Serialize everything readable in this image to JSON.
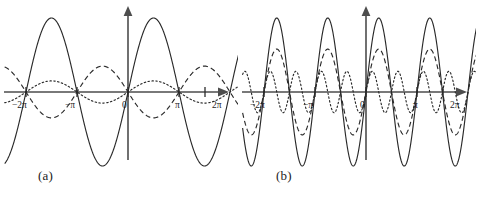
{
  "figure": {
    "background_color": "#ffffff",
    "stroke_color": "#2a2a2a",
    "axis_color": "#4d4d4d",
    "panels": [
      {
        "caption": "(a)",
        "caption_x": 38,
        "axis": {
          "x_tick_labels": [
            "−2π",
            "−π",
            "0",
            "π",
            "2π"
          ],
          "x_tick_values": [
            -6.2832,
            -3.1416,
            0,
            3.1416,
            6.2832
          ],
          "x_arrow_label": "",
          "xlim": [
            -7.6,
            7.7
          ],
          "ylim": [
            -1.12,
            1.12
          ],
          "grid": false
        }
      },
      {
        "caption": "(b)",
        "caption_x": 38,
        "axis": {
          "x_tick_labels": [
            "−2π",
            "−π",
            "0",
            "π",
            "2π"
          ],
          "x_tick_values": [
            -6.2832,
            -3.1416,
            0,
            3.1416,
            6.2832
          ],
          "x_arrow_label": "",
          "xlim": [
            -7.6,
            7.7
          ],
          "ylim": [
            -1.12,
            1.12
          ],
          "grid": false
        }
      }
    ]
  },
  "chart_data": [
    {
      "type": "line",
      "title": "(a)",
      "xlabel": "",
      "ylabel": "",
      "xlim": [
        -7.6,
        7.7
      ],
      "ylim": [
        -1.12,
        1.12
      ],
      "grid": false,
      "legend": "none",
      "xtick_labels": [
        "−2π",
        "−π",
        "0",
        "π",
        "2π"
      ],
      "xtick_values": [
        -6.2832,
        -3.1416,
        0,
        3.1416,
        6.2832
      ],
      "series": [
        {
          "name": "solid",
          "style": "solid",
          "amplitude": 1.0,
          "frequency": 1,
          "phase": 0,
          "formula": "sin(x)",
          "samples_x": [
            -7.6,
            -6.2832,
            -4.7124,
            -3.1416,
            -1.5708,
            0,
            1.5708,
            3.1416,
            4.7124,
            6.2832,
            7.7
          ],
          "samples_y": [
            -0.968,
            0,
            1.0,
            0,
            -1.0,
            0,
            1.0,
            0,
            -1.0,
            0,
            0.992
          ]
        },
        {
          "name": "dashed",
          "style": "dashed",
          "amplitude": 0.35,
          "frequency": 1,
          "phase": 3.1416,
          "formula": "-0.35*sin(x)",
          "samples_x": [
            -7.6,
            -6.2832,
            -4.7124,
            -3.1416,
            -1.5708,
            0,
            1.5708,
            3.1416,
            4.7124,
            6.2832,
            7.7
          ],
          "samples_y": [
            0.339,
            0,
            -0.35,
            0,
            0.35,
            0,
            -0.35,
            0,
            0.35,
            0,
            -0.347
          ]
        },
        {
          "name": "dotted",
          "style": "dotted",
          "amplitude": 0.15,
          "frequency": 1,
          "phase": 0,
          "formula": "0.15*sin(x)",
          "samples_x": [
            -7.6,
            -6.2832,
            -4.7124,
            -3.1416,
            -1.5708,
            0,
            1.5708,
            3.1416,
            4.7124,
            6.2832,
            7.7
          ],
          "samples_y": [
            -0.145,
            0,
            0.15,
            0,
            -0.15,
            0,
            0.15,
            0,
            -0.15,
            0,
            0.149
          ]
        }
      ]
    },
    {
      "type": "line",
      "title": "(b)",
      "xlabel": "",
      "ylabel": "",
      "xlim": [
        -7.6,
        7.7
      ],
      "ylim": [
        -1.12,
        1.12
      ],
      "grid": false,
      "legend": "none",
      "xtick_labels": [
        "−2π",
        "−π",
        "0",
        "π",
        "2π"
      ],
      "xtick_values": [
        -6.2832,
        -3.1416,
        0,
        3.1416,
        6.2832
      ],
      "series": [
        {
          "name": "solid",
          "style": "solid",
          "amplitude": 1.0,
          "frequency": 2,
          "phase": 0,
          "formula": "sin(2x)",
          "samples_x": [
            -7.6,
            -6.2832,
            -5.4978,
            -4.7124,
            -3.927,
            -3.1416,
            -2.3562,
            -1.5708,
            -0.7854,
            0,
            0.7854,
            1.5708,
            2.3562,
            3.1416,
            3.927,
            4.7124,
            5.4978,
            6.2832,
            7.7
          ],
          "samples_y": [
            -0.48,
            0,
            1.0,
            0,
            -1.0,
            0,
            1.0,
            0,
            -1.0,
            0,
            1.0,
            0,
            -1.0,
            0,
            1.0,
            0,
            -1.0,
            0,
            0.49
          ]
        },
        {
          "name": "dashed",
          "style": "dashed",
          "amplitude": 0.58,
          "frequency": 2,
          "phase": 0,
          "formula": "0.58*sin(2x)",
          "samples_x": [
            -7.6,
            -6.2832,
            -5.4978,
            -4.7124,
            -3.927,
            -3.1416,
            -2.3562,
            -1.5708,
            -0.7854,
            0,
            0.7854,
            1.5708,
            2.3562,
            3.1416,
            3.927,
            4.7124,
            5.4978,
            6.2832,
            7.7
          ],
          "samples_y": [
            -0.28,
            0,
            0.58,
            0,
            -0.58,
            0,
            0.58,
            0,
            -0.58,
            0,
            0.58,
            0,
            -0.58,
            0,
            0.58,
            0,
            -0.58,
            0,
            0.284
          ]
        },
        {
          "name": "dotted",
          "style": "dotted",
          "amplitude": 0.28,
          "frequency": 4,
          "phase": 0,
          "formula": "0.28*sin(4x)",
          "samples_x": [
            -7.6,
            -6.2832,
            -5.8905,
            -5.4978,
            -5.1051,
            -4.7124,
            -4.3197,
            -3.927,
            -3.5343,
            -3.1416,
            -2.7489,
            -2.3562,
            -1.9635,
            -1.5708,
            -1.1781,
            -0.7854,
            -0.3927,
            0,
            0.3927,
            0.7854,
            1.1781,
            1.5708,
            1.9635,
            2.3562,
            2.7489,
            3.1416,
            3.5343,
            3.927,
            4.3197,
            4.7124,
            5.1051,
            5.4978,
            5.8905,
            6.2832,
            7.7
          ],
          "samples_y": [
            0.264,
            0,
            0.28,
            0,
            -0.28,
            0,
            0.28,
            0,
            -0.28,
            0,
            0.28,
            0,
            -0.28,
            0,
            0.28,
            0,
            -0.28,
            0,
            0.28,
            0,
            -0.28,
            0,
            0.28,
            0,
            -0.28,
            0,
            0.28,
            0,
            -0.28,
            0,
            0.28,
            0,
            -0.28,
            0,
            -0.268
          ]
        }
      ]
    }
  ]
}
